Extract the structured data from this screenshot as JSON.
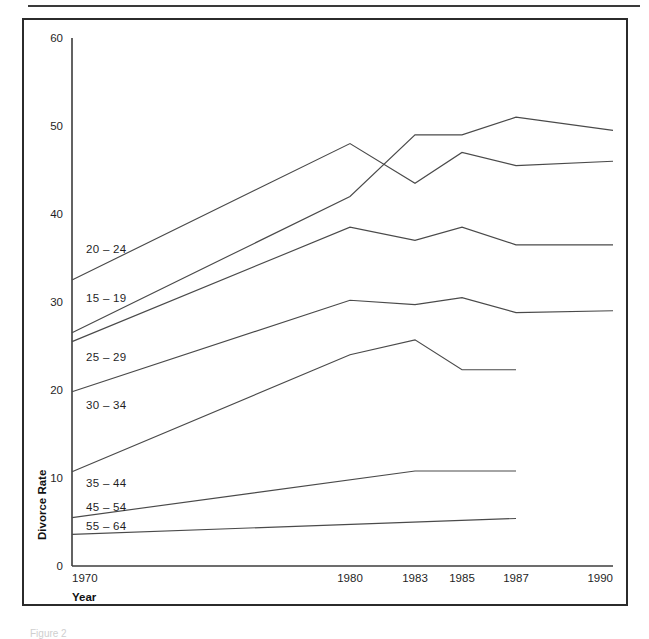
{
  "figure": {
    "caption": "Figure 2"
  },
  "chart_data": {
    "type": "line",
    "title": "",
    "xlabel": "Year",
    "ylabel": "Divorce Rate",
    "grid": false,
    "legend_position": "inline-left",
    "x": [
      1970,
      1980,
      1983,
      1985,
      1987,
      1990
    ],
    "x_tick_labels": [
      "1970",
      "1980",
      "1983",
      "1985",
      "1987",
      "1990"
    ],
    "y_tick_labels": [
      "0",
      "10",
      "20",
      "30",
      "40",
      "50",
      "60"
    ],
    "y_ticks": [
      0,
      10,
      20,
      30,
      40,
      50,
      60
    ],
    "ylim": [
      0,
      60
    ],
    "xlim": [
      1970,
      1990
    ],
    "series": [
      {
        "name": "15 – 19",
        "x": [
          1970,
          1980,
          1983,
          1985,
          1987,
          1990
        ],
        "values": [
          26.5,
          42.0,
          49.0,
          49.0,
          51.0,
          49.5
        ]
      },
      {
        "name": "20 – 24",
        "x": [
          1970,
          1980,
          1983,
          1985,
          1987,
          1990
        ],
        "values": [
          32.5,
          48.0,
          43.5,
          47.0,
          45.5,
          46.0
        ]
      },
      {
        "name": "25 – 29",
        "x": [
          1970,
          1980,
          1983,
          1985,
          1987,
          1990
        ],
        "values": [
          25.5,
          38.5,
          37.0,
          38.5,
          36.5,
          36.5
        ]
      },
      {
        "name": "30 – 34",
        "x": [
          1970,
          1980,
          1983,
          1985,
          1987,
          1990
        ],
        "values": [
          19.8,
          30.2,
          29.7,
          30.5,
          28.8,
          29.0
        ]
      },
      {
        "name": "35 – 44",
        "x": [
          1970,
          1980,
          1983,
          1985,
          1987
        ],
        "values": [
          10.7,
          24.0,
          25.7,
          22.3,
          22.3
        ]
      },
      {
        "name": "45 – 54",
        "x": [
          1970,
          1983,
          1987
        ],
        "values": [
          5.5,
          10.8,
          10.8
        ]
      },
      {
        "name": "55 – 64",
        "x": [
          1970,
          1987
        ],
        "values": [
          3.6,
          5.4
        ]
      }
    ],
    "inline_labels": [
      {
        "text": "20 – 24",
        "value": 36.0,
        "x_px": 86
      },
      {
        "text": "15 – 19",
        "value": 30.5,
        "x_px": 86
      },
      {
        "text": "25 – 29",
        "value": 23.7,
        "x_px": 86
      },
      {
        "text": "30 – 34",
        "value": 18.3,
        "x_px": 86
      },
      {
        "text": "35 – 44",
        "value": 9.4,
        "x_px": 86
      },
      {
        "text": "45 – 54",
        "value": 6.7,
        "x_px": 86
      },
      {
        "text": "55 – 64",
        "value": 4.5,
        "x_px": 86
      }
    ]
  }
}
